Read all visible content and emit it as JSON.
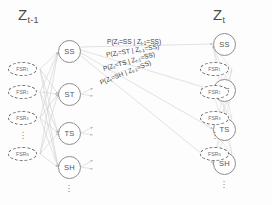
{
  "diagram": {
    "title_left": "Z",
    "title_left_sub": "t-1",
    "title_right": "Z",
    "title_right_sub": "t",
    "ellipsis_glyph": "·"
  },
  "left_slice": {
    "states": [
      {
        "label": "SS"
      },
      {
        "label": "ST"
      },
      {
        "label": "TS"
      },
      {
        "label": "SH"
      }
    ],
    "observations": [
      {
        "label": "FSR",
        "sub": "1"
      },
      {
        "label": "FSR",
        "sub": "2"
      },
      {
        "label": "FSR",
        "sub": "3"
      },
      {
        "label": "FSR",
        "sub": "N"
      }
    ]
  },
  "right_slice": {
    "states": [
      {
        "label": "SS"
      },
      {
        "label": "ST"
      },
      {
        "label": "TS"
      },
      {
        "label": "SH"
      }
    ],
    "observations": [
      {
        "label": "FSR",
        "sub": "1"
      },
      {
        "label": "FSR",
        "sub": "2"
      },
      {
        "label": "FSR",
        "sub": "3"
      },
      {
        "label": "FSR",
        "sub": "N"
      }
    ]
  },
  "transition_labels": [
    {
      "text": "P(Z",
      "sub1": "t",
      "mid": "=SS | Z",
      "sub2": "t-1",
      "end": "=SS)"
    },
    {
      "text": "P(Z",
      "sub1": "t",
      "mid": "=ST | Z",
      "sub2": "t-1",
      "end": "=SS)"
    },
    {
      "text": "P(Z",
      "sub1": "t",
      "mid": "=TS | Z",
      "sub2": "t-1",
      "end": "=SS)"
    },
    {
      "text": "P(Z",
      "sub1": "t",
      "mid": "=SH | Z",
      "sub2": "t-1",
      "end": "=SS)"
    }
  ],
  "colors": {
    "state_stroke": "#8d8d8d",
    "obs_stroke": "#6f6f6f",
    "edge": "#c9c9c9",
    "text": "#4a4a4a"
  }
}
